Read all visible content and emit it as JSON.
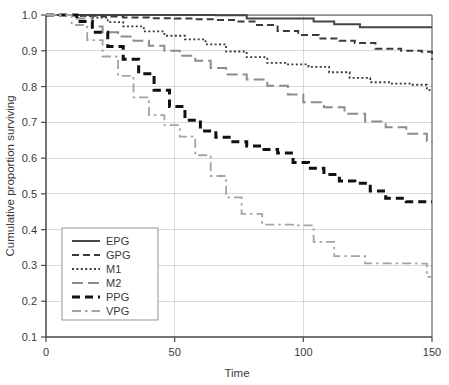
{
  "chart_data": {
    "type": "line",
    "subtype": "kaplan-meier-step",
    "title": "",
    "xlabel": "Time",
    "ylabel": "Cumulative proportion surviving",
    "xlim": [
      0,
      150
    ],
    "ylim": [
      0.1,
      1.0
    ],
    "xticks": [
      0,
      50,
      100,
      150
    ],
    "xtick_labels": [
      "0",
      "50",
      "100",
      "150"
    ],
    "yticks": [
      0.1,
      0.2,
      0.3,
      0.4,
      0.5,
      0.6,
      0.7,
      0.8,
      0.9,
      1.0
    ],
    "ytick_labels": [
      "0.1",
      "0.2",
      "0.3",
      "0.4",
      "0.5",
      "0.6",
      "0.7",
      "0.8",
      "0.9",
      "1.0"
    ],
    "grid": true,
    "grid_axis": "y",
    "legend_position": "lower-left",
    "series": [
      {
        "name": "EPG",
        "color": "#454545",
        "width": 2.0,
        "dash": "none",
        "x": [
          0,
          5,
          42,
          52,
          66,
          78,
          104,
          112,
          122,
          150
        ],
        "y": [
          1.0,
          1.0,
          1.0,
          1.0,
          0.999,
          0.99,
          0.982,
          0.974,
          0.966,
          0.966
        ]
      },
      {
        "name": "GPG",
        "color": "#3a3a3a",
        "width": 2.0,
        "dash": "7,4",
        "x": [
          0,
          6,
          14,
          22,
          30,
          40,
          50,
          58,
          66,
          74,
          82,
          90,
          98,
          106,
          114,
          120,
          128,
          138,
          146,
          150
        ],
        "y": [
          1.0,
          1.0,
          0.998,
          0.996,
          0.993,
          0.991,
          0.99,
          0.988,
          0.986,
          0.982,
          0.972,
          0.955,
          0.944,
          0.934,
          0.928,
          0.922,
          0.906,
          0.9,
          0.897,
          0.875
        ]
      },
      {
        "name": "M1",
        "color": "#3a3a3a",
        "width": 1.8,
        "dash": "2,2.4",
        "x": [
          0,
          6,
          12,
          18,
          24,
          30,
          38,
          46,
          54,
          62,
          70,
          78,
          86,
          94,
          102,
          110,
          118,
          126,
          134,
          142,
          148,
          150
        ],
        "y": [
          1.0,
          1.0,
          0.997,
          0.993,
          0.98,
          0.968,
          0.954,
          0.942,
          0.932,
          0.918,
          0.898,
          0.882,
          0.866,
          0.862,
          0.855,
          0.84,
          0.824,
          0.812,
          0.808,
          0.805,
          0.79,
          0.79
        ]
      },
      {
        "name": "M2",
        "color": "#8c8c8c",
        "width": 2.0,
        "dash": "11,5",
        "x": [
          0,
          6,
          12,
          18,
          22,
          28,
          34,
          40,
          46,
          52,
          58,
          64,
          70,
          78,
          86,
          94,
          100,
          108,
          116,
          124,
          132,
          140,
          148,
          150
        ],
        "y": [
          1.0,
          1.0,
          0.99,
          0.968,
          0.952,
          0.94,
          0.928,
          0.914,
          0.9,
          0.886,
          0.872,
          0.852,
          0.834,
          0.82,
          0.802,
          0.778,
          0.756,
          0.742,
          0.724,
          0.702,
          0.686,
          0.668,
          0.648,
          0.642
        ]
      },
      {
        "name": "PPG",
        "color": "#111111",
        "width": 3.0,
        "dash": "8,5",
        "x": [
          0,
          6,
          12,
          18,
          24,
          30,
          36,
          42,
          48,
          54,
          60,
          66,
          72,
          78,
          84,
          90,
          96,
          102,
          108,
          114,
          120,
          126,
          132,
          140,
          150
        ],
        "y": [
          1.0,
          1.0,
          0.982,
          0.952,
          0.912,
          0.876,
          0.836,
          0.79,
          0.744,
          0.706,
          0.676,
          0.658,
          0.646,
          0.634,
          0.624,
          0.614,
          0.588,
          0.572,
          0.554,
          0.536,
          0.53,
          0.508,
          0.488,
          0.478,
          0.478
        ]
      },
      {
        "name": "VPG",
        "color": "#a3a3a3",
        "width": 1.8,
        "dash": "9,4,2.5,4",
        "x": [
          0,
          6,
          10,
          16,
          22,
          28,
          34,
          40,
          46,
          52,
          58,
          64,
          70,
          76,
          84,
          90,
          96,
          104,
          112,
          120,
          124,
          134,
          144,
          148,
          150
        ],
        "y": [
          1.0,
          1.0,
          0.972,
          0.93,
          0.884,
          0.83,
          0.77,
          0.72,
          0.692,
          0.66,
          0.608,
          0.55,
          0.49,
          0.444,
          0.414,
          0.414,
          0.412,
          0.366,
          0.326,
          0.326,
          0.306,
          0.306,
          0.305,
          0.268,
          0.266
        ]
      }
    ]
  },
  "legend": {
    "entries": [
      {
        "label": "EPG"
      },
      {
        "label": "GPG"
      },
      {
        "label": "M1"
      },
      {
        "label": "M2"
      },
      {
        "label": "PPG"
      },
      {
        "label": "VPG"
      }
    ]
  },
  "colors": {
    "background": "#ffffff",
    "axis": "#4a4a4a",
    "grid": "#c9c9c9",
    "text": "#3a3a3a"
  }
}
